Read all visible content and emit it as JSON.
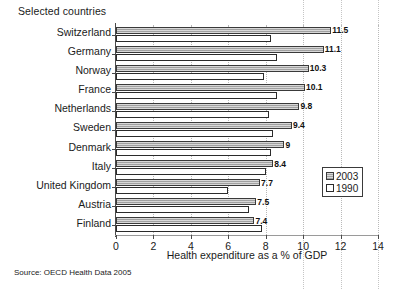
{
  "figure": {
    "top_caption": "Selected countries",
    "source_note": "Source: OECD Health Data 2005"
  },
  "legend": {
    "items": [
      {
        "label": "2003",
        "swatch": "filled-gray-square-icon"
      },
      {
        "label": "1990",
        "swatch": "empty-white-square-icon"
      }
    ]
  },
  "chart_data": {
    "type": "bar",
    "orientation": "horizontal",
    "title": "Selected countries",
    "xlabel": "Health expenditure as a % of GDP",
    "ylabel": "",
    "xlim": [
      0,
      14
    ],
    "xticks": [
      0,
      2,
      4,
      6,
      8,
      10,
      12,
      14
    ],
    "xtick_labels": [
      "0",
      "2",
      "4",
      "6",
      "8",
      "10",
      "12",
      "14"
    ],
    "grid": true,
    "grid_axis": "x",
    "legend_position": "center-right",
    "categories": [
      "Switzerland",
      "Germany",
      "Norway",
      "France",
      "Netherlands",
      "Sweden",
      "Denmark",
      "Italy",
      "United Kingdom",
      "Austria",
      "Finland"
    ],
    "series": [
      {
        "name": "2003",
        "values": [
          11.5,
          11.1,
          10.3,
          10.1,
          9.8,
          9.4,
          9,
          8.4,
          7.7,
          7.5,
          7.4
        ],
        "labels": [
          "11.5",
          "11.1",
          "10.3",
          "10.1",
          "9.8",
          "9.4",
          "9",
          "8.4",
          "7.7",
          "7.5",
          "7.4"
        ],
        "color": "#a9a9a9"
      },
      {
        "name": "1990",
        "values": [
          8.3,
          8.6,
          7.9,
          8.6,
          8.2,
          8.4,
          8.3,
          8.0,
          6.0,
          7.1,
          7.8
        ],
        "labels": [
          "",
          "",
          "",
          "",
          "",
          "",
          "",
          "",
          "",
          "",
          ""
        ],
        "color": "#ffffff"
      }
    ]
  }
}
